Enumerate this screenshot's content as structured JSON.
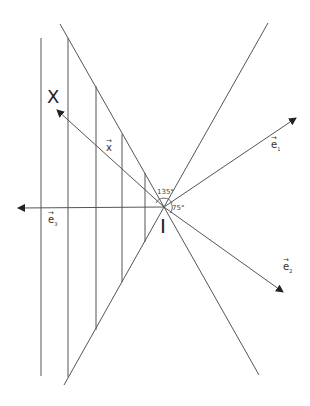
{
  "diagram": {
    "type": "geometric vector diagram",
    "stroke_color": "#555555",
    "background": "#ffffff",
    "point_I": {
      "label": "I",
      "x": 164,
      "y": 207
    },
    "point_X": {
      "label": "X"
    },
    "vectors": [
      {
        "name": "e1",
        "label": "e",
        "subscript": "1",
        "arrow": "→"
      },
      {
        "name": "e2",
        "label": "e",
        "subscript": "2",
        "arrow": "→"
      },
      {
        "name": "e3",
        "label": "e",
        "subscript": "3",
        "arrow": "→"
      },
      {
        "name": "x",
        "label": "x",
        "arrow": "→"
      }
    ],
    "angles": [
      {
        "label": "135°"
      },
      {
        "label": "75°"
      }
    ]
  }
}
